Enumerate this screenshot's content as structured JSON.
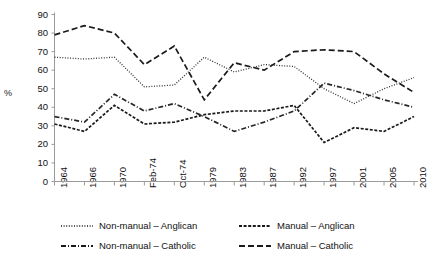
{
  "chart_data": {
    "type": "line",
    "title": "",
    "subtitle": "",
    "xlabel": "",
    "ylabel": "%",
    "ylim": [
      0,
      90
    ],
    "yticks": [
      0,
      10,
      20,
      30,
      40,
      50,
      60,
      70,
      80,
      90
    ],
    "grid": false,
    "legend_position": "bottom",
    "categories": [
      "1964",
      "1966",
      "1970",
      "Feb-74",
      "Oct-74",
      "1979",
      "1983",
      "1987",
      "1992",
      "1997",
      "2001",
      "2005",
      "2010"
    ],
    "series": [
      {
        "name": "Non-manual – Anglican",
        "style": "dotted",
        "color": "#333333",
        "values": [
          67,
          66,
          67,
          51,
          52,
          67,
          59,
          63,
          62,
          50,
          42,
          50,
          56
        ]
      },
      {
        "name": "Manual – Anglican",
        "style": "dashed-short",
        "color": "#1a1a1a",
        "values": [
          31,
          27,
          41,
          31,
          32,
          36,
          38,
          38,
          41,
          21,
          29,
          27,
          35
        ]
      },
      {
        "name": "Non-manual – Catholic",
        "style": "dash-dot",
        "color": "#262626",
        "values": [
          35,
          32,
          47,
          38,
          42,
          35,
          27,
          32,
          38,
          53,
          49,
          44,
          40
        ]
      },
      {
        "name": "Manual – Catholic",
        "style": "dashed-long",
        "color": "#1a1a1a",
        "values": [
          79,
          84,
          80,
          63,
          73,
          44,
          64,
          60,
          70,
          71,
          70,
          58,
          48
        ]
      }
    ]
  },
  "axis": {
    "y_label": "%",
    "y_tick_labels": [
      "90",
      "80",
      "70",
      "60",
      "50",
      "40",
      "30",
      "20",
      "10",
      "0"
    ],
    "x_tick_labels": [
      "1964",
      "1966",
      "1970",
      "Feb-74",
      "Oct-74",
      "1979",
      "1983",
      "1987",
      "1992",
      "1997",
      "2001",
      "2005",
      "2010"
    ]
  },
  "legend": {
    "items": [
      {
        "label": "Non-manual – Anglican",
        "style": "dotted"
      },
      {
        "label": "Manual – Anglican",
        "style": "dashed-short"
      },
      {
        "label": "Non-manual – Catholic",
        "style": "dash-dot"
      },
      {
        "label": "Manual – Catholic",
        "style": "dashed-long"
      }
    ]
  }
}
